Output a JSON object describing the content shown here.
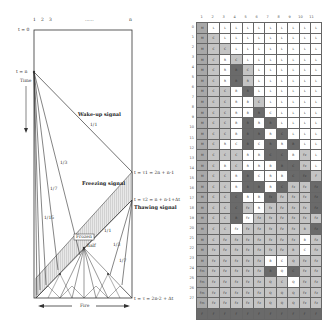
{
  "diagram": {
    "cell_labels": [
      "1",
      "2",
      "3",
      "......",
      "n"
    ],
    "time_labels": {
      "t0": "t = 0",
      "tn": "t = n",
      "time_axis": "Time",
      "t1": "t = τ1 = 2n + n-1",
      "t2": "t = τ2 = n + n-1+Δt",
      "tend": "t = τ = 2n-2 + Δt"
    },
    "signals": {
      "wakeup": "Wake-up signal",
      "freezing": "Freezing signal",
      "thawing": "Thawing signal",
      "frozen": "Frozen",
      "half": "half",
      "fire": "Fire"
    },
    "slopes": [
      "1/1",
      "1/3",
      "1/7",
      "1/15",
      "1/1",
      "1/3",
      "1/7"
    ],
    "colors": {
      "line": "#333333",
      "hatch": "#bbbbbb"
    }
  },
  "table": {
    "columns": [
      "1",
      "2",
      "3",
      "4",
      "5",
      "6",
      "7",
      "8",
      "9",
      "10",
      "11"
    ],
    "rows": [
      "0",
      "1",
      "2",
      "3",
      "4",
      "5",
      "6",
      "7",
      "8",
      "9",
      "10",
      "11",
      "12",
      "13",
      "14",
      "15",
      "16",
      "17",
      "18",
      "19",
      "20",
      "21",
      "22",
      "23",
      "24",
      "25",
      "26",
      "27"
    ],
    "shading": [
      "mwwwwwwwwww",
      "mlwwwwwwwww",
      "mllwwwwwwww",
      "mlwlwwwwwww",
      "mlwdlwwwwww",
      "mlwdlwwwwww",
      "mllwdwwwwww",
      "mllwwlwwwww",
      "mllwwdwwwww",
      "mllwdwdwwww",
      "mllwddwdwww",
      "mlwwdwdwdww",
      "mlllwwddwlw",
      "mlwlwwwddlw",
      "mllwdwwwddl",
      "mllwddwdlld",
      "mlldwwdllld",
      "mlldlwlllld",
      "mlldwllllll",
      "mllwlllllld",
      "mllllllllwl",
      "mllllllllwl",
      "mlllllwwlll",
      "mllllldwdll",
      "mlllllllwll",
      "mllllllllll",
      "mllllllllll",
      "ddddddddddd"
    ],
    "texts": [
      [
        "M",
        "L",
        "L",
        "L",
        "L",
        "L",
        "L",
        "L",
        "L",
        "L",
        "L"
      ],
      [
        "M",
        "C",
        "L",
        "L",
        "L",
        "L",
        "L",
        "L",
        "L",
        "L",
        "L"
      ],
      [
        "M",
        "C",
        "C",
        "L",
        "L",
        "L",
        "L",
        "L",
        "L",
        "L",
        "L"
      ],
      [
        "M",
        "C",
        "R",
        "C",
        "L",
        "L",
        "L",
        "L",
        "L",
        "L",
        "L"
      ],
      [
        "M",
        "C",
        "R",
        "B",
        "C",
        "L",
        "L",
        "L",
        "L",
        "L",
        "L"
      ],
      [
        "M",
        "C",
        "R",
        "B",
        "R",
        "L",
        "L",
        "L",
        "L",
        "L",
        "L"
      ],
      [
        "M",
        "C",
        "C",
        "B",
        "R",
        "L",
        "L",
        "L",
        "L",
        "L",
        "L"
      ],
      [
        "M",
        "C",
        "C",
        "R",
        "B",
        "C",
        "L",
        "L",
        "L",
        "L",
        "L"
      ],
      [
        "M",
        "C",
        "C",
        "R",
        "B",
        "R",
        "C",
        "L",
        "L",
        "L",
        "L"
      ],
      [
        "M",
        "C",
        "C",
        "B",
        "R",
        "R",
        "B",
        "L",
        "L",
        "L",
        "L"
      ],
      [
        "M",
        "C",
        "C",
        "B",
        "B",
        "R",
        "R",
        "C",
        "L",
        "L",
        "L"
      ],
      [
        "M",
        "C",
        "R",
        "C",
        "B",
        "C",
        "R",
        "R",
        "B",
        "L",
        "L"
      ],
      [
        "M",
        "C",
        "C",
        "C",
        "R",
        "B",
        "C",
        "C",
        "B",
        "Fz",
        "L"
      ],
      [
        "M",
        "C",
        "B",
        "C",
        "R",
        "R",
        "B",
        "B",
        "C",
        "Fz",
        "L"
      ],
      [
        "M",
        "C",
        "C",
        "R",
        "B",
        "C",
        "R",
        "B",
        "C",
        "Fz",
        "F"
      ],
      [
        "M",
        "C",
        "C",
        "R",
        "B",
        "B",
        "R",
        "C",
        "Fz",
        "Fz",
        "Fz"
      ],
      [
        "M",
        "C",
        "C",
        "C",
        "R",
        "B",
        "Fz",
        "Fz",
        "Fz",
        "Fz",
        "Fz"
      ],
      [
        "M",
        "C",
        "C",
        "C",
        "Fz",
        "R",
        "Fz",
        "Fz",
        "Fz",
        "Fz",
        "Fz"
      ],
      [
        "M",
        "C",
        "C",
        "B",
        "Fz",
        "Fz",
        "Fz",
        "Fz",
        "Fz",
        "Fz",
        "Fz"
      ],
      [
        "M",
        "C",
        "C",
        "Fz",
        "Fz",
        "Fz",
        "Fz",
        "Fz",
        "Fz",
        "B",
        "Fz"
      ],
      [
        "M",
        "C",
        "Fz",
        "Fz",
        "Fz",
        "Fz",
        "Fz",
        "Fz",
        "Fz",
        "B",
        "Fz"
      ],
      [
        "M",
        "Fz",
        "Fz",
        "Fz",
        "Fz",
        "Fz",
        "Fz",
        "Fz",
        "B",
        "C",
        "Fz"
      ],
      [
        "M",
        "Fz",
        "Fz",
        "Fz",
        "Fz",
        "Fz",
        "B",
        "C",
        "Q",
        "Fz",
        "Fz"
      ],
      [
        "Fm",
        "Fz",
        "Fz",
        "Fz",
        "Fz",
        "Fz",
        "B",
        "Q",
        "C",
        "Fz",
        "Fz"
      ],
      [
        "Fm",
        "Fz",
        "Fz",
        "Fz",
        "Fz",
        "Fz",
        "Q",
        "C",
        "Q",
        "Fz",
        "Fz"
      ],
      [
        "Fm",
        "Fz",
        "Fz",
        "Fz",
        "Fz",
        "Fz",
        "Q",
        "Q",
        "Q",
        "Fz",
        "Fz"
      ],
      [
        "Fm",
        "Fz",
        "Fz",
        "Fz",
        "Fz",
        "Fz",
        "Q",
        "Q",
        "Q",
        "Fz",
        "Fz"
      ],
      [
        "F",
        "F",
        "F",
        "F",
        "F",
        "F",
        "F",
        "F",
        "F",
        "F",
        "F"
      ]
    ],
    "colors": {
      "w": "#ffffff",
      "l": "#c4c4c4",
      "m": "#a8a8a8",
      "d": "#6a6a6a"
    }
  }
}
